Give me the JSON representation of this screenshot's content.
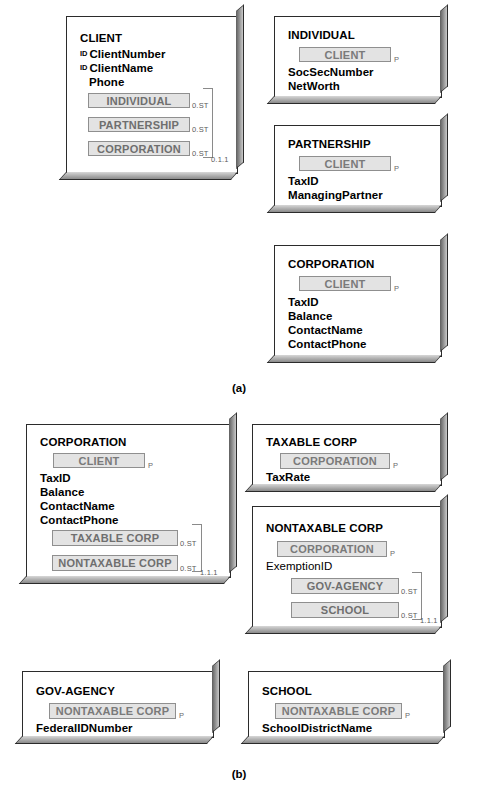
{
  "figure": {
    "panels": [
      {
        "id": "a",
        "caption": "(a)",
        "entities": [
          {
            "name": "CLIENT",
            "identifiers": [
              "ClientNumber",
              "ClientName"
            ],
            "attributes": [
              "Phone"
            ],
            "subtypes": [
              "INDIVIDUAL",
              "PARTNERSHIP",
              "CORPORATION"
            ],
            "subtype_cardinalities": [
              "0.ST",
              "0.ST",
              "0.ST"
            ],
            "group_cardinality": "0.1.1",
            "id_marker": "ID"
          },
          {
            "name": "INDIVIDUAL",
            "supertype": "CLIENT",
            "supertype_marker": "P",
            "attributes": [
              "SocSecNumber",
              "NetWorth"
            ]
          },
          {
            "name": "PARTNERSHIP",
            "supertype": "CLIENT",
            "supertype_marker": "P",
            "attributes": [
              "TaxID",
              "ManagingPartner"
            ]
          },
          {
            "name": "CORPORATION",
            "supertype": "CLIENT",
            "supertype_marker": "P",
            "attributes": [
              "TaxID",
              "Balance",
              "ContactName",
              "ContactPhone"
            ]
          }
        ]
      },
      {
        "id": "b",
        "caption": "(b)",
        "entities": [
          {
            "name": "CORPORATION",
            "supertype": "CLIENT",
            "supertype_marker": "P",
            "attributes": [
              "TaxID",
              "Balance",
              "ContactName",
              "ContactPhone"
            ],
            "subtypes": [
              "TAXABLE CORP",
              "NONTAXABLE CORP"
            ],
            "subtype_cardinalities": [
              "0.ST",
              "0.ST"
            ],
            "group_cardinality": "1.1.1"
          },
          {
            "name": "TAXABLE CORP",
            "supertype": "CORPORATION",
            "supertype_marker": "P",
            "attributes": [
              "TaxRate"
            ]
          },
          {
            "name": "NONTAXABLE CORP",
            "supertype": "CORPORATION",
            "supertype_marker": "P",
            "attributes": [
              "ExemptionID"
            ],
            "subtypes": [
              "GOV-AGENCY",
              "SCHOOL"
            ],
            "subtype_cardinalities": [
              "0.ST",
              "0.ST"
            ],
            "group_cardinality": "1.1.1"
          },
          {
            "name": "GOV-AGENCY",
            "supertype": "NONTAXABLE CORP",
            "supertype_marker": "P",
            "attributes": [
              "FederalIDNumber"
            ]
          },
          {
            "name": "SCHOOL",
            "supertype": "NONTAXABLE CORP",
            "supertype_marker": "P",
            "attributes": [
              "SchoolDistrictName"
            ]
          }
        ]
      }
    ]
  },
  "a": {
    "client": {
      "title": "CLIENT",
      "id_marker": "ID",
      "attr1": "ClientNumber",
      "attr2": "ClientName",
      "attr3": "Phone",
      "sub1": "INDIVIDUAL",
      "sub2": "PARTNERSHIP",
      "sub3": "CORPORATION",
      "card1": "0.ST",
      "card2": "0.ST",
      "card3": "0.ST",
      "group_card": "0.1.1"
    },
    "individual": {
      "title": "INDIVIDUAL",
      "supertype": "CLIENT",
      "p": "P",
      "attr1": "SocSecNumber",
      "attr2": "NetWorth"
    },
    "partnership": {
      "title": "PARTNERSHIP",
      "supertype": "CLIENT",
      "p": "P",
      "attr1": "TaxID",
      "attr2": "ManagingPartner"
    },
    "corporation": {
      "title": "CORPORATION",
      "supertype": "CLIENT",
      "p": "P",
      "attr1": "TaxID",
      "attr2": "Balance",
      "attr3": "ContactName",
      "attr4": "ContactPhone"
    },
    "caption": "(a)"
  },
  "b": {
    "corporation": {
      "title": "CORPORATION",
      "supertype": "CLIENT",
      "p": "P",
      "attr1": "TaxID",
      "attr2": "Balance",
      "attr3": "ContactName",
      "attr4": "ContactPhone",
      "sub1": "TAXABLE CORP",
      "sub2": "NONTAXABLE CORP",
      "card1": "0.ST",
      "card2": "0.ST",
      "group_card": "1.1.1"
    },
    "taxable": {
      "title": "TAXABLE CORP",
      "supertype": "CORPORATION",
      "p": "P",
      "attr1": "TaxRate"
    },
    "nontaxable": {
      "title": "NONTAXABLE CORP",
      "supertype": "CORPORATION",
      "p": "P",
      "attr1": "ExemptionID",
      "sub1": "GOV-AGENCY",
      "sub2": "SCHOOL",
      "card1": "0.ST",
      "card2": "0.ST",
      "group_card": "1.1.1"
    },
    "gov": {
      "title": "GOV-AGENCY",
      "supertype": "NONTAXABLE CORP",
      "p": "P",
      "attr1": "FederalIDNumber"
    },
    "school": {
      "title": "SCHOOL",
      "supertype": "NONTAXABLE CORP",
      "p": "P",
      "attr1": "SchoolDistrictName"
    },
    "caption": "(b)"
  }
}
